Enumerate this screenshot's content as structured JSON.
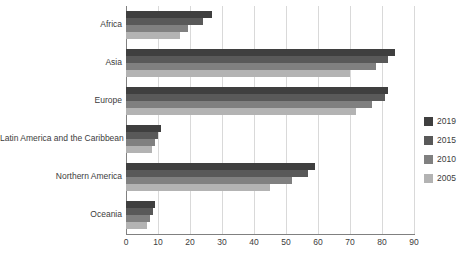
{
  "chart_data": {
    "type": "bar",
    "orientation": "horizontal",
    "title": "",
    "subtitle": "",
    "xlabel": "",
    "ylabel": "",
    "xlim": [
      0,
      90
    ],
    "xticks": [
      0,
      10,
      20,
      30,
      40,
      50,
      60,
      70,
      80,
      90
    ],
    "xtick_labels": [
      "0",
      "10",
      "20",
      "30",
      "40",
      "50",
      "60",
      "70",
      "80",
      "90"
    ],
    "grid": true,
    "legend_position": "right",
    "categories": [
      "Africa",
      "Asia",
      "Europe",
      "Latin America and the Caribbean",
      "Northern America",
      "Oceania"
    ],
    "series": [
      {
        "name": "2019",
        "color": "#3f3f3f",
        "values": [
          27,
          84,
          82,
          11,
          59,
          9
        ]
      },
      {
        "name": "2015",
        "color": "#595959",
        "values": [
          24,
          82,
          81,
          10,
          57,
          8.5
        ]
      },
      {
        "name": "2010",
        "color": "#808080",
        "values": [
          19.5,
          78,
          77,
          9,
          52,
          7.5
        ]
      },
      {
        "name": "2005",
        "color": "#b3b3b3",
        "values": [
          17,
          70,
          72,
          8,
          45,
          6.5
        ]
      }
    ]
  },
  "colors": {
    "gridline": "#d9d9d9",
    "axis": "#808080",
    "text": "#3c3c3c",
    "background": "#ffffff"
  }
}
